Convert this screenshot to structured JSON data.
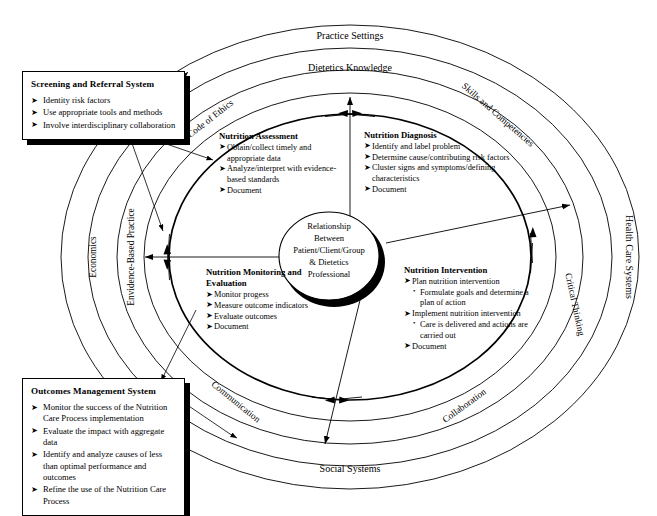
{
  "rings": {
    "outer": "Practice Settings",
    "outer_right": "Health Care Systems",
    "outer_bottom": "Social Systems",
    "outer_left": "Economics",
    "inner_top": "Dietetics Knowledge",
    "inner_right_top": "Skills and Competencies",
    "inner_right_bottom": "Critical Thinking",
    "inner_bottom_right": "Collaboration",
    "inner_bottom_left": "Communication",
    "inner_left": "Envidence-Based Practice",
    "inner_left_top": "Code of Ethics"
  },
  "center": {
    "line1": "Relationship",
    "line2": "Between",
    "line3": "Patient/Client/Group",
    "line4": "& Dietetics",
    "line5": "Professional"
  },
  "callouts": {
    "screening": {
      "title": "Screening and Referral System",
      "items": [
        "Identity risk factors",
        "Use appropriate tools and methods",
        "Involve interdisciplinary collaboration"
      ]
    },
    "outcomes": {
      "title": "Outcomes Management System",
      "items": [
        "Monitor the success of the Nutrition Care Process implementation",
        "Evaluate the impact with aggregate data",
        "Identify and analyze causes of less than optimal performance and outcomes",
        "Refine the use of the Nutrition Care Process"
      ]
    }
  },
  "phases": {
    "assessment": {
      "title": "Nutrition Assessment",
      "items": [
        "Obtain/collect timely and appropriate data",
        "Analyze/interpret with evidence-based standards",
        "Document"
      ]
    },
    "diagnosis": {
      "title": "Nutrition Diagnosis",
      "items": [
        "Identify and label problem",
        "Determine cause/contributing risk factors",
        "Cluster signs and symptoms/defining characteristics",
        "Document"
      ]
    },
    "intervention": {
      "title": "Nutrition Intervention",
      "item1": "Plan nutrition intervention",
      "sub1": "Formulate goals and determine a plan of action",
      "item2": "Implement nutrition intervention",
      "sub2": "Care is delivered and actions are carried out",
      "item3": "Document"
    },
    "monitoring": {
      "title": "Nutrition Monitoring and Evaluation",
      "items": [
        "Monitor progess",
        "Measure outcome indicators",
        "Evaluate outcomes",
        "Document"
      ]
    }
  },
  "glyphs": {
    "bullet_arrow": "➤",
    "bullet_dot": "•"
  },
  "colors": {
    "stroke": "#000000",
    "background": "#ffffff",
    "shadow": "#000000"
  }
}
